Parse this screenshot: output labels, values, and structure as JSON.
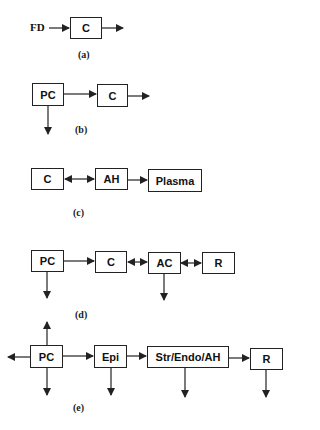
{
  "panels": [
    {
      "id": "a",
      "label": "(a)",
      "input_label": "FD",
      "nodes": [
        "C"
      ]
    },
    {
      "id": "b",
      "label": "(b)",
      "nodes": [
        "PC",
        "C"
      ]
    },
    {
      "id": "c",
      "label": "(c)",
      "nodes": [
        "C",
        "AH",
        "Plasma"
      ]
    },
    {
      "id": "d",
      "label": "(d)",
      "nodes": [
        "PC",
        "C",
        "AC",
        "R"
      ]
    },
    {
      "id": "e",
      "label": "(e)",
      "nodes": [
        "PC",
        "Epi",
        "Str/Endo/AH",
        "R"
      ]
    }
  ],
  "edges": {
    "a": [
      "FD -> C",
      "C -> out"
    ],
    "b": [
      "PC -> C",
      "C -> out",
      "PC -> down"
    ],
    "c": [
      "C <-> AH",
      "AH -> Plasma"
    ],
    "d": [
      "PC -> C",
      "C <-> AC",
      "AC <-> R",
      "PC -> down",
      "AC -> down"
    ],
    "e": [
      "PC -> up",
      "PC -> left",
      "PC -> down",
      "PC -> Epi",
      "Epi -> Str/Endo/AH",
      "Str/Endo/AH -> R",
      "Epi -> down",
      "Str/Endo/AH -> down",
      "R -> down"
    ]
  },
  "colors": {
    "line": "#222222",
    "background": "#ffffff"
  }
}
